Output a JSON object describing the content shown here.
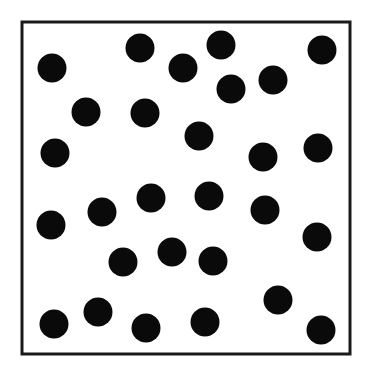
{
  "frame": {
    "x": 22,
    "y": 22,
    "width": 328,
    "height": 332,
    "stroke": "#1a1a1a",
    "stroke_width": 3
  },
  "dot_color": "#0a0a0a",
  "dot_radius": 14.5,
  "dots": [
    [
      52,
      68
    ],
    [
      140,
      48
    ],
    [
      183,
      68
    ],
    [
      221,
      45
    ],
    [
      322,
      50
    ],
    [
      231,
      89
    ],
    [
      273,
      80
    ],
    [
      86,
      112
    ],
    [
      145,
      113
    ],
    [
      55,
      153
    ],
    [
      199,
      136
    ],
    [
      263,
      157
    ],
    [
      318,
      148
    ],
    [
      151,
      198
    ],
    [
      209,
      196
    ],
    [
      102,
      212
    ],
    [
      265,
      210
    ],
    [
      51,
      225
    ],
    [
      317,
      237
    ],
    [
      172,
      252
    ],
    [
      123,
      262
    ],
    [
      213,
      261
    ],
    [
      278,
      300
    ],
    [
      98,
      312
    ],
    [
      54,
      324
    ],
    [
      146,
      328
    ],
    [
      205,
      322
    ],
    [
      321,
      330
    ]
  ]
}
